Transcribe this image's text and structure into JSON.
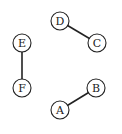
{
  "graph": {
    "nodes": [
      {
        "id": "A",
        "label": "A",
        "x": 60,
        "y": 110
      },
      {
        "id": "B",
        "label": "B",
        "x": 96,
        "y": 88
      },
      {
        "id": "C",
        "label": "C",
        "x": 97,
        "y": 43
      },
      {
        "id": "D",
        "label": "D",
        "x": 60,
        "y": 21
      },
      {
        "id": "E",
        "label": "E",
        "x": 22,
        "y": 43
      },
      {
        "id": "F",
        "label": "F",
        "x": 22,
        "y": 88
      }
    ],
    "edges": [
      {
        "from": "D",
        "to": "C"
      },
      {
        "from": "E",
        "to": "F"
      },
      {
        "from": "A",
        "to": "B"
      }
    ],
    "node_radius": 9
  }
}
